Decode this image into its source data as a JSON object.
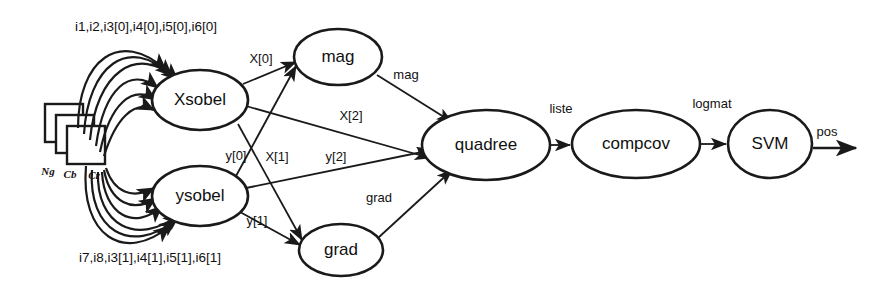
{
  "diagram": {
    "type": "dataflow-graph",
    "title": "",
    "background_color": "#ffffff",
    "stroke_color": "#1a1a1a",
    "nodes": [
      {
        "id": "xsobel",
        "label": "Xsobel",
        "shape": "ellipse",
        "cx": 200,
        "cy": 100,
        "rx": 48,
        "ry": 30
      },
      {
        "id": "ysobel",
        "label": "ysobel",
        "shape": "ellipse",
        "cx": 200,
        "cy": 196,
        "rx": 48,
        "ry": 30
      },
      {
        "id": "mag",
        "label": "mag",
        "shape": "ellipse",
        "cx": 338,
        "cy": 57,
        "rx": 44,
        "ry": 28
      },
      {
        "id": "grad",
        "label": "grad",
        "shape": "ellipse",
        "cx": 341,
        "cy": 250,
        "rx": 42,
        "ry": 26
      },
      {
        "id": "quadree",
        "label": "quadree",
        "shape": "ellipse",
        "cx": 486,
        "cy": 145,
        "rx": 64,
        "ry": 35
      },
      {
        "id": "compcov",
        "label": "compcov",
        "shape": "ellipse",
        "cx": 636,
        "cy": 144,
        "rx": 64,
        "ry": 34
      },
      {
        "id": "svm",
        "label": "SVM",
        "shape": "ellipse",
        "cx": 770,
        "cy": 144,
        "rx": 42,
        "ry": 34
      }
    ],
    "input_planes": {
      "labels": [
        "Ng",
        "Cb",
        "Cr"
      ],
      "count": 3
    },
    "input_bundles": [
      {
        "id": "top-inputs",
        "label": "i1,i2,i3[0],i4[0],i5[0],i6[0]",
        "target": "xsobel"
      },
      {
        "id": "bottom-inputs",
        "label": "i7,i8,i3[1],i4[1],i5[1],i6[1]",
        "target": "ysobel"
      }
    ],
    "edges": [
      {
        "id": "xsobel-mag",
        "label": "X[0]",
        "from": "xsobel",
        "to": "mag"
      },
      {
        "id": "xsobel-grad",
        "label": "X[1]",
        "from": "xsobel",
        "to": "grad"
      },
      {
        "id": "xsobel-quadree",
        "label": "X[2]",
        "from": "xsobel",
        "to": "quadree"
      },
      {
        "id": "ysobel-mag",
        "label": "y[0]",
        "from": "ysobel",
        "to": "mag"
      },
      {
        "id": "ysobel-grad",
        "label": "y[1]",
        "from": "ysobel",
        "to": "grad"
      },
      {
        "id": "ysobel-quadree",
        "label": "y[2]",
        "from": "ysobel",
        "to": "quadree"
      },
      {
        "id": "mag-quadree",
        "label": "mag",
        "from": "mag",
        "to": "quadree"
      },
      {
        "id": "grad-quadree",
        "label": "grad",
        "from": "grad",
        "to": "quadree"
      },
      {
        "id": "quadree-compcov",
        "label": "liste",
        "from": "quadree",
        "to": "compcov"
      },
      {
        "id": "compcov-svm",
        "label": "logmat",
        "from": "compcov",
        "to": "svm"
      },
      {
        "id": "svm-output",
        "label": "pos",
        "from": "svm",
        "to": "output"
      }
    ]
  }
}
